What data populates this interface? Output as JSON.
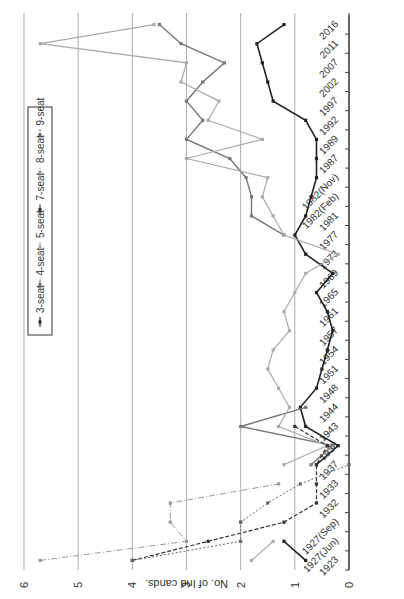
{
  "chart_data": {
    "type": "line",
    "orientation": "rotated 90° clockwise",
    "title": "",
    "xlabel": "",
    "ylabel": "No. of Ind cands.",
    "ylim": [
      0,
      6
    ],
    "yticks": [
      0,
      1,
      2,
      3,
      4,
      5,
      6
    ],
    "grid": true,
    "legend_position": "top (boxed)",
    "categories": [
      "1923",
      "1927(Jun)",
      "1927(Sep)",
      "1932",
      "1933",
      "1937",
      "1938",
      "1943",
      "1944",
      "1948",
      "1951",
      "1954",
      "1957",
      "1961",
      "1965",
      "1969",
      "1973",
      "1977",
      "1981",
      "1982(Feb)",
      "1982(Nov)",
      "1987",
      "1989",
      "1992",
      "1997",
      "2002",
      "2007",
      "2011",
      "2016"
    ],
    "series": [
      {
        "name": "3-seat",
        "style": "solid-dark-square",
        "color": "#222222",
        "values": [
          0.8,
          1.2,
          null,
          null,
          null,
          0.6,
          0.2,
          0.8,
          0.9,
          0.6,
          0.5,
          0.4,
          0.3,
          0.4,
          0.6,
          0.3,
          0.8,
          1.0,
          0.8,
          0.7,
          0.6,
          0.6,
          0.6,
          0.8,
          1.4,
          1.5,
          1.6,
          1.7,
          1.2
        ]
      },
      {
        "name": "4-seat",
        "style": "solid-gray",
        "color": "#777777",
        "values": [
          null,
          null,
          2.0,
          null,
          null,
          0.7,
          0.3,
          2.0,
          0.8,
          null,
          null,
          null,
          null,
          null,
          null,
          null,
          null,
          1.2,
          1.8,
          1.8,
          1.9,
          2.2,
          3.0,
          2.7,
          3.0,
          2.7,
          2.3,
          3.1,
          3.5
        ]
      },
      {
        "name": "5-seat",
        "style": "solid-lightgray",
        "color": "#aaaaaa",
        "values": [
          1.8,
          1.4,
          null,
          null,
          null,
          1.2,
          0.4,
          1.3,
          1.1,
          1.3,
          1.5,
          1.4,
          1.1,
          1.2,
          1.0,
          0.8,
          0.2,
          1.2,
          1.4,
          1.6,
          1.5,
          3.0,
          1.6,
          2.6,
          2.4,
          3.1,
          3.0,
          5.7,
          3.6
        ]
      },
      {
        "name": "7-seat",
        "style": "dashed-dark",
        "color": "#333333",
        "values": [
          4.0,
          2.6,
          1.2,
          0.6,
          0.6,
          0.6,
          0.4,
          1.0,
          null,
          null,
          null,
          null,
          null,
          null,
          null,
          null,
          null,
          null,
          null,
          null,
          null,
          null,
          null,
          null,
          null,
          null,
          null,
          null,
          null
        ]
      },
      {
        "name": "8-seat",
        "style": "dashdot-lightgray",
        "color": "#999999",
        "values": [
          5.7,
          3.0,
          3.3,
          3.3,
          1.3,
          null,
          null,
          null,
          null,
          null,
          null,
          null,
          null,
          null,
          null,
          null,
          null,
          null,
          null,
          null,
          null,
          null,
          null,
          null,
          null,
          null,
          null,
          null,
          null
        ]
      },
      {
        "name": "9-seat",
        "style": "dashed-gray",
        "color": "#666666",
        "values": [
          4.0,
          2.0,
          2.0,
          1.5,
          0.9,
          0.0,
          null,
          null,
          null,
          null,
          null,
          null,
          null,
          null,
          null,
          null,
          null,
          null,
          null,
          null,
          null,
          null,
          null,
          null,
          null,
          null,
          null,
          null,
          null
        ]
      }
    ]
  }
}
